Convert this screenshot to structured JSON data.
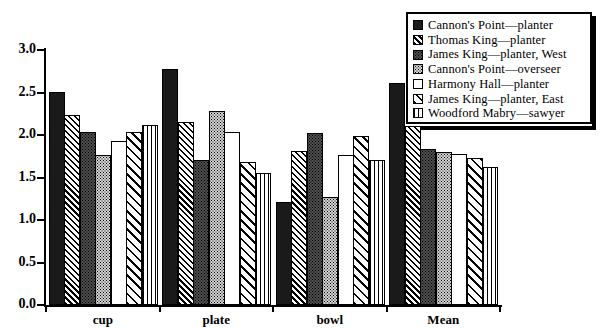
{
  "chart_data": {
    "type": "bar",
    "title": "",
    "xlabel": "",
    "ylabel": "",
    "ylim": [
      0.0,
      3.0
    ],
    "ytick_labels": [
      "0.0",
      "0.5",
      "1.0",
      "1.5",
      "2.0",
      "2.5",
      "3.0"
    ],
    "ytick_values": [
      0.0,
      0.5,
      1.0,
      1.5,
      2.0,
      2.5,
      3.0
    ],
    "grid": false,
    "legend_position": "top-right",
    "categories": [
      "cup",
      "plate",
      "bowl",
      "Mean"
    ],
    "series": [
      {
        "name": "Cannon's Point—planter",
        "pattern": "solid-black",
        "values": [
          2.51,
          2.78,
          1.21,
          2.61
        ]
      },
      {
        "name": "Thomas King—planter",
        "pattern": "dense-diagonal-hatch",
        "values": [
          2.23,
          2.15,
          1.81,
          2.11
        ]
      },
      {
        "name": "James King—planter, West",
        "pattern": "dark-stipple",
        "values": [
          2.04,
          1.71,
          2.02,
          1.84
        ]
      },
      {
        "name": "Cannon's Point—overseer",
        "pattern": "light-stipple",
        "values": [
          1.76,
          2.28,
          1.27,
          1.8
        ]
      },
      {
        "name": "Harmony Hall—planter",
        "pattern": "white-empty",
        "values": [
          1.93,
          2.03,
          1.76,
          1.78
        ]
      },
      {
        "name": "James King—planter, East",
        "pattern": "wide-diagonal-hatch",
        "values": [
          2.03,
          1.68,
          1.99,
          1.73
        ]
      },
      {
        "name": "Woodford Mabry—sawyer",
        "pattern": "vertical-lines",
        "values": [
          2.12,
          1.55,
          1.71,
          1.62
        ]
      }
    ]
  },
  "legend": {
    "items": [
      {
        "label": "Cannon's Point—planter"
      },
      {
        "label": "Thomas King—planter"
      },
      {
        "label": "James King—planter, West"
      },
      {
        "label": "Cannon's Point—overseer"
      },
      {
        "label": "Harmony Hall—planter"
      },
      {
        "label": "James King—planter, East"
      },
      {
        "label": "Woodford Mabry—sawyer"
      }
    ]
  },
  "colors": {
    "ink": "#000000",
    "paper": "#ffffff",
    "bar_solid": "#1a1a1a",
    "bar_dark_stipple": "#4d4d4d",
    "bar_light_stipple": "#d4d4d4"
  }
}
